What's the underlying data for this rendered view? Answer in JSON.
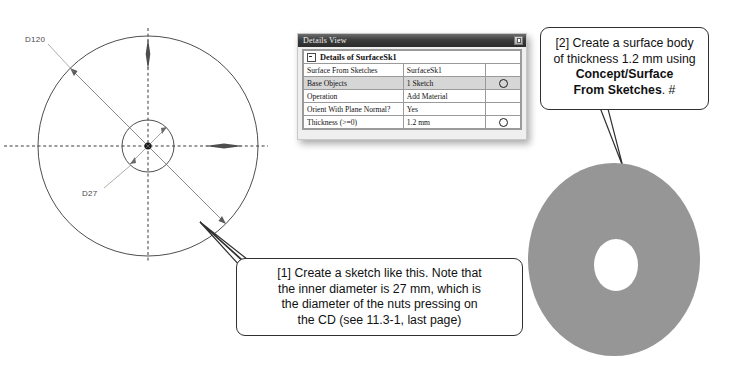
{
  "sketch": {
    "name": "cd-sketch",
    "outer_dimension_label": "D120",
    "inner_dimension_label": "D27",
    "outer_diameter_mm": 120,
    "inner_diameter_mm": 27
  },
  "details_panel": {
    "title": "Details View",
    "pin_button": "pin-button",
    "group_header": "Details of SurfaceSk1",
    "rows": [
      {
        "name": "Surface From Sketches",
        "value": "SurfaceSk1",
        "action": "",
        "highlight": false
      },
      {
        "name": "Base Objects",
        "value": "1 Sketch",
        "action": "circle",
        "highlight": true
      },
      {
        "name": "Operation",
        "value": "Add Material",
        "action": "",
        "highlight": false
      },
      {
        "name": "Orient With Plane Normal?",
        "value": "Yes",
        "action": "",
        "highlight": false
      },
      {
        "name": "Thickness (>=0)",
        "value": "1.2 mm",
        "action": "circle",
        "highlight": false
      }
    ]
  },
  "callouts": {
    "one": {
      "line1": "[1] Create a sketch like this.  Note that",
      "line2": "the inner diameter is 27 mm, which is",
      "line3": "the diameter of the nuts pressing on",
      "line4": "the CD (see 11.3-1, last page)"
    },
    "two": {
      "line1": "[2] Create a surface body",
      "line2": "of thickness 1.2 mm using",
      "line3_bold": "Concept/Surface",
      "line4_bold": "From Sketches",
      "line4_tail": ". #"
    }
  },
  "disk": {
    "name": "surface-body-disk",
    "fill_color": "#969696",
    "hole_color": "#ffffff"
  }
}
